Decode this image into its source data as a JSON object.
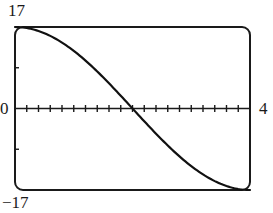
{
  "chart_data": {
    "type": "line",
    "title": "",
    "xlabel": "",
    "ylabel": "",
    "xlim": [
      0,
      4
    ],
    "ylim": [
      -17,
      17
    ],
    "x_tick_labels": [
      "0",
      "4"
    ],
    "y_tick_labels": [
      "17",
      "-17"
    ],
    "x_tick_spacing": 0.2,
    "y_tick_marks": [
      8.5,
      -8.5
    ],
    "grid": false,
    "legend": null,
    "frame": "rounded-rectangle viewing window",
    "series": [
      {
        "name": "f(x) = 17 cos(pi x / 4)",
        "x": [
          0,
          0.25,
          0.5,
          0.75,
          1,
          1.25,
          1.5,
          1.75,
          2,
          2.25,
          2.5,
          2.75,
          3,
          3.25,
          3.5,
          3.75,
          4
        ],
        "values": [
          17,
          16.67,
          15.71,
          14.14,
          12.02,
          9.44,
          6.51,
          3.32,
          0,
          -3.32,
          -6.51,
          -9.44,
          -12.02,
          -14.14,
          -15.71,
          -16.67,
          -17
        ]
      }
    ],
    "colors": {
      "curve": "#111111",
      "frame": "#1a1a1a",
      "axis": "#1a1a1a"
    }
  },
  "labels": {
    "y_max": "17",
    "y_min": "−17",
    "x_min": "0",
    "x_max": "4"
  }
}
